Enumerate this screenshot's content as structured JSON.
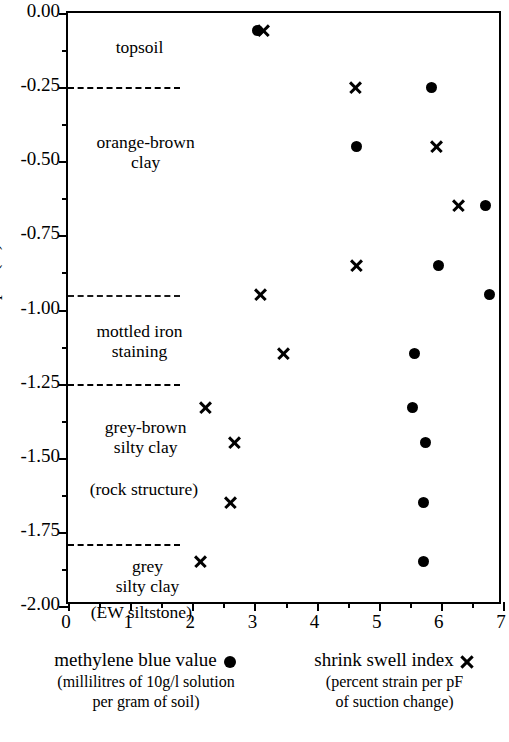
{
  "chart_data": {
    "type": "scatter",
    "title": "",
    "xlabel": "",
    "ylabel": "depth (m)",
    "xlim": [
      0,
      7
    ],
    "ylim": [
      -2.0,
      0.0
    ],
    "xticks": [
      "0",
      "1",
      "2",
      "3",
      "4",
      "5",
      "6",
      "7"
    ],
    "xtick_values": [
      0,
      1,
      2,
      3,
      4,
      5,
      6,
      7
    ],
    "x_minor_step": 0.5,
    "yticks": [
      "0.00",
      "-0.25",
      "-0.50",
      "-0.75",
      "-1.00",
      "-1.25",
      "-1.50",
      "-1.75",
      "-2.00"
    ],
    "ytick_values": [
      0.0,
      -0.25,
      -0.5,
      -0.75,
      -1.0,
      -1.25,
      -1.5,
      -1.75,
      -2.0
    ],
    "y_minor_step": 0.125,
    "grid": false,
    "legend_position": "below-axes",
    "series": [
      {
        "name": "methylene blue value",
        "marker": "filled-circle",
        "color": "#000000",
        "points": [
          {
            "x": 3.05,
            "y": -0.06
          },
          {
            "x": 5.85,
            "y": -0.25
          },
          {
            "x": 4.65,
            "y": -0.45
          },
          {
            "x": 6.72,
            "y": -0.65
          },
          {
            "x": 5.97,
            "y": -0.85
          },
          {
            "x": 6.78,
            "y": -0.95
          },
          {
            "x": 5.57,
            "y": -1.15
          },
          {
            "x": 5.55,
            "y": -1.33
          },
          {
            "x": 5.75,
            "y": -1.45
          },
          {
            "x": 5.72,
            "y": -1.65
          },
          {
            "x": 5.72,
            "y": -1.85
          }
        ]
      },
      {
        "name": "shrink swell index",
        "marker": "cross",
        "color": "#000000",
        "points": [
          {
            "x": 3.15,
            "y": -0.06
          },
          {
            "x": 4.62,
            "y": -0.25
          },
          {
            "x": 5.93,
            "y": -0.45
          },
          {
            "x": 6.28,
            "y": -0.65
          },
          {
            "x": 4.65,
            "y": -0.85
          },
          {
            "x": 3.1,
            "y": -0.95
          },
          {
            "x": 3.47,
            "y": -1.15
          },
          {
            "x": 2.22,
            "y": -1.33
          },
          {
            "x": 2.68,
            "y": -1.45
          },
          {
            "x": 2.62,
            "y": -1.65
          },
          {
            "x": 2.14,
            "y": -1.85
          }
        ]
      }
    ],
    "strata_boundaries": [
      {
        "depth": -0.25,
        "style": "dashed",
        "extent_x": 1.8
      },
      {
        "depth": -0.95,
        "style": "dotted",
        "extent_x": 1.8
      },
      {
        "depth": -1.25,
        "style": "dashed",
        "extent_x": 1.8
      },
      {
        "depth": -1.79,
        "style": "dashed",
        "extent_x": 1.8
      }
    ],
    "strata_labels": [
      {
        "lines": [
          "topsoil"
        ],
        "x": 1.15,
        "y": -0.115
      },
      {
        "lines": [
          "orange-brown",
          "clay"
        ],
        "x": 1.25,
        "y": -0.47
      },
      {
        "lines": [
          "mottled iron",
          "staining"
        ],
        "x": 1.15,
        "y": -1.105
      },
      {
        "lines": [
          "grey-brown",
          "silty clay"
        ],
        "x": 1.25,
        "y": -1.43
      },
      {
        "lines": [
          "(rock structure)"
        ],
        "x": 1.22,
        "y": -1.605
      },
      {
        "lines": [
          "grey",
          "silty clay"
        ],
        "x": 1.28,
        "y": -1.9
      },
      {
        "lines": [
          "(EW siltstone)"
        ],
        "x": 1.18,
        "y": -2.02
      }
    ]
  },
  "legend": {
    "entries": [
      {
        "label": "methylene blue value",
        "marker": "filled-circle-marker",
        "sublines": [
          "(millilitres of 10g/l solution",
          "per gram of soil)"
        ]
      },
      {
        "label": "shrink swell index",
        "marker": "cross-marker",
        "sublines": [
          "(percent strain per pF",
          "of suction change)"
        ]
      }
    ]
  }
}
